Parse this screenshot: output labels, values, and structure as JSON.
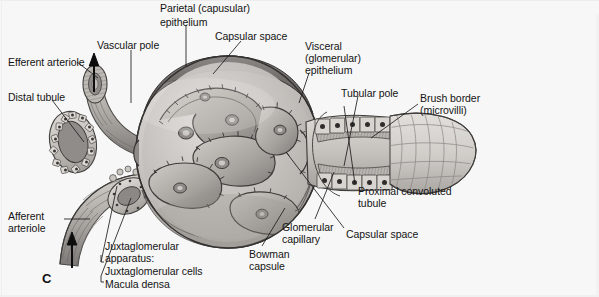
{
  "figure": {
    "id": "C",
    "background_color": "#f7f7f7",
    "ink_color": "#141414"
  },
  "labels": [
    {
      "name": "efferent-arteriole",
      "text": "Efferent arteriole",
      "x": 8,
      "y": 57
    },
    {
      "name": "distal-tubule",
      "text": "Distal tubule",
      "x": 8,
      "y": 92
    },
    {
      "name": "vascular-pole",
      "text": "Vascular pole",
      "x": 97,
      "y": 40
    },
    {
      "name": "parietal-epithelium-l1",
      "text": "Parietal (capusular)",
      "x": 160,
      "y": 3
    },
    {
      "name": "parietal-epithelium-l2",
      "text": "epithelium",
      "x": 160,
      "y": 17
    },
    {
      "name": "capsular-space-top",
      "text": "Capsular space",
      "x": 215,
      "y": 31
    },
    {
      "name": "visceral-epithelium-l1",
      "text": "Visceral",
      "x": 305,
      "y": 41
    },
    {
      "name": "visceral-epithelium-l2",
      "text": "(glomerular)",
      "x": 305,
      "y": 53
    },
    {
      "name": "visceral-epithelium-l3",
      "text": "epithelium",
      "x": 305,
      "y": 65
    },
    {
      "name": "tubular-pole",
      "text": "Tubular pole",
      "x": 341,
      "y": 88
    },
    {
      "name": "brush-border-l1",
      "text": "Brush border",
      "x": 420,
      "y": 93
    },
    {
      "name": "brush-border-l2",
      "text": "(microvilli)",
      "x": 420,
      "y": 105
    },
    {
      "name": "proximal-convoluted-l1",
      "text": "Proximal convoluted",
      "x": 358,
      "y": 186
    },
    {
      "name": "proximal-convoluted-l2",
      "text": "tubule",
      "x": 358,
      "y": 198
    },
    {
      "name": "capsular-space-bottom",
      "text": "Capsular space",
      "x": 346,
      "y": 229
    },
    {
      "name": "glomerular-capillary-l1",
      "text": "Glomerular",
      "x": 282,
      "y": 222
    },
    {
      "name": "glomerular-capillary-l2",
      "text": "capillary",
      "x": 282,
      "y": 234
    },
    {
      "name": "bowman-capsule-l1",
      "text": "Bowman",
      "x": 249,
      "y": 249
    },
    {
      "name": "bowman-capsule-l2",
      "text": "capsule",
      "x": 249,
      "y": 261
    },
    {
      "name": "afferent-arteriole-l1",
      "text": "Afferent",
      "x": 8,
      "y": 211
    },
    {
      "name": "afferent-arteriole-l2",
      "text": "arteriole",
      "x": 8,
      "y": 223
    },
    {
      "name": "juxtaglomerular-apparatus-l1",
      "text": "Juxtaglomerular",
      "x": 105,
      "y": 241
    },
    {
      "name": "juxtaglomerular-apparatus-l2",
      "text": "apparatus:",
      "x": 105,
      "y": 253
    },
    {
      "name": "juxtaglomerular-cells",
      "text": "Juxtaglomerular cells",
      "x": 105,
      "y": 266
    },
    {
      "name": "macula-densa",
      "text": "Macula densa",
      "x": 105,
      "y": 279
    }
  ],
  "figure_label": {
    "text": "C",
    "x": 42,
    "y": 271
  },
  "structures": [
    {
      "name": "bowman-capsule",
      "kind": "sphere"
    },
    {
      "name": "glomerular-capillary-tuft",
      "kind": "capillary-loops"
    },
    {
      "name": "proximal-convoluted-tubule",
      "kind": "tubule-flare"
    },
    {
      "name": "distal-tubule-cross-section",
      "kind": "oval-tubule"
    },
    {
      "name": "efferent-arteriole-vessel",
      "kind": "vessel"
    },
    {
      "name": "afferent-arteriole-vessel",
      "kind": "vessel"
    },
    {
      "name": "macula-densa-region",
      "kind": "cell-band"
    }
  ],
  "flow_arrows": [
    {
      "name": "efferent-flow-arrow",
      "direction": "up",
      "x": 93,
      "y": 60
    },
    {
      "name": "afferent-flow-arrow",
      "direction": "up",
      "x": 72,
      "y": 236
    }
  ]
}
